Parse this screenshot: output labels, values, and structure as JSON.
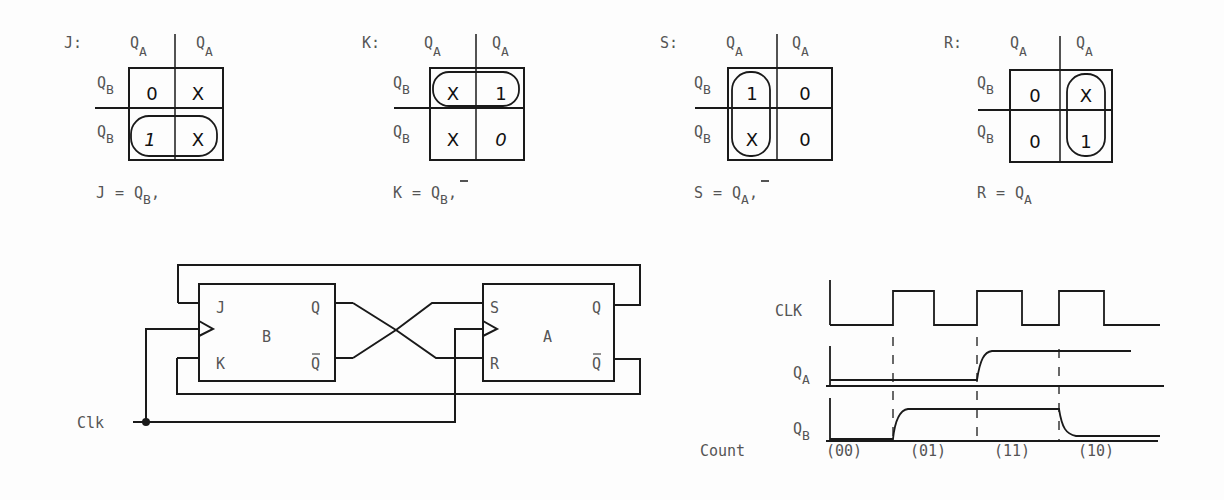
{
  "kmaps": [
    {
      "name": "J",
      "label": "J:",
      "col_headers": [
        "Q",
        "Q"
      ],
      "col_subs": [
        "A",
        "A"
      ],
      "row_headers": [
        "Q",
        "Q"
      ],
      "row_subs": [
        "B",
        "B"
      ],
      "cells": [
        [
          "0",
          "X"
        ],
        [
          "1",
          "X"
        ]
      ],
      "grouping": "bottom row",
      "equation": {
        "lhs": "J",
        "eq": "=",
        "var": "Q",
        "sub": "B",
        "bar": false,
        "trail": ","
      }
    },
    {
      "name": "K",
      "label": "K:",
      "col_headers": [
        "Q",
        "Q"
      ],
      "col_subs": [
        "A",
        "A"
      ],
      "row_headers": [
        "Q",
        "Q"
      ],
      "row_subs": [
        "B",
        "B"
      ],
      "cells": [
        [
          "X",
          "1"
        ],
        [
          "X",
          "0"
        ]
      ],
      "grouping": "top row",
      "equation": {
        "lhs": "K",
        "eq": "=",
        "var": "Q",
        "sub": "B",
        "bar": true,
        "trail": ","
      }
    },
    {
      "name": "S",
      "label": "S:",
      "col_headers": [
        "Q",
        "Q"
      ],
      "col_subs": [
        "A",
        "A"
      ],
      "row_headers": [
        "Q",
        "Q"
      ],
      "row_subs": [
        "B",
        "B"
      ],
      "cells": [
        [
          "1",
          "0"
        ],
        [
          "X",
          "0"
        ]
      ],
      "grouping": "left column",
      "equation": {
        "lhs": "S",
        "eq": "=",
        "var": "Q",
        "sub": "A",
        "bar": true,
        "trail": ","
      }
    },
    {
      "name": "R",
      "label": "R:",
      "col_headers": [
        "Q",
        "Q"
      ],
      "col_subs": [
        "A",
        "A"
      ],
      "row_headers": [
        "Q",
        "Q"
      ],
      "row_subs": [
        "B",
        "B"
      ],
      "cells": [
        [
          "0",
          "X"
        ],
        [
          "0",
          "1"
        ]
      ],
      "grouping": "right column",
      "equation": {
        "lhs": "R",
        "eq": "=",
        "var": "Q",
        "sub": "A",
        "bar": false,
        "trail": ""
      }
    }
  ],
  "circuit": {
    "ff_b": {
      "name": "B",
      "in_top": "J",
      "in_bottom": "K",
      "out_top": "Q",
      "out_bottom": "Q"
    },
    "ff_a": {
      "name": "A",
      "in_top": "S",
      "in_bottom": "R",
      "out_top": "Q",
      "out_bottom": "Q"
    },
    "clock_label": "Clk"
  },
  "timing": {
    "signals": [
      {
        "name": "CLK",
        "sub": ""
      },
      {
        "name": "Q",
        "sub": "A"
      },
      {
        "name": "Q",
        "sub": "B"
      }
    ],
    "count_label": "Count",
    "counts": [
      "(00)",
      "(01)",
      "(11)",
      "(10)"
    ]
  }
}
